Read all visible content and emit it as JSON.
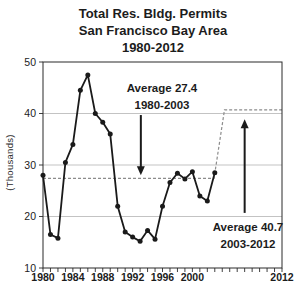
{
  "chart_data": {
    "type": "line",
    "title": "Total Res. Bldg. Permits",
    "subtitle": "San Francisco Bay Area",
    "period": "1980-2012",
    "ylabel": "(Thousands)",
    "xlim": [
      1980,
      2012
    ],
    "ylim": [
      10,
      50
    ],
    "y_ticks": [
      10,
      20,
      30,
      40,
      50
    ],
    "x_tick_labels": [
      1980,
      1984,
      1988,
      1992,
      1996,
      2000,
      2012
    ],
    "x_minor_tick_interval": 1,
    "gridlines_y": [
      20,
      30,
      40
    ],
    "grid_color": "#b4b4b4",
    "axis_color": "#2b2b2b",
    "series": [
      {
        "name": "total-residential-building-permits",
        "color": "#1a1a1a",
        "marker": "circle",
        "x": [
          1980,
          1981,
          1982,
          1983,
          1984,
          1985,
          1986,
          1987,
          1988,
          1989,
          1990,
          1991,
          1992,
          1993,
          1994,
          1995,
          1996,
          1997,
          1998,
          1999,
          2000,
          2001,
          2002,
          2003
        ],
        "values": [
          28,
          16.5,
          15.8,
          30.5,
          34,
          44.5,
          47.5,
          40,
          38.3,
          36,
          22,
          17,
          16,
          15.2,
          17.3,
          15.6,
          22,
          26.6,
          28.4,
          27.3,
          28.7,
          24,
          23,
          28.5
        ]
      }
    ],
    "average_line": {
      "color": "#8c8c8c",
      "style": "dashed",
      "points": [
        [
          1980,
          27.4
        ],
        [
          2002.9,
          27.4
        ],
        [
          2004.3,
          40.7
        ],
        [
          2012,
          40.7
        ]
      ]
    },
    "annotations": [
      {
        "line1": "Average 27.4",
        "line2": "1980-2003",
        "value": 27.4
      },
      {
        "line1": "Average 40.7",
        "line2": "2003-2012",
        "value": 40.7
      }
    ],
    "arrows": [
      {
        "direction": "down",
        "x": 1993.1,
        "from_value": 39.7,
        "to_value": 28.0
      },
      {
        "direction": "up",
        "x": 2007.0,
        "from_value": 20.7,
        "to_value": 38.9
      }
    ]
  }
}
